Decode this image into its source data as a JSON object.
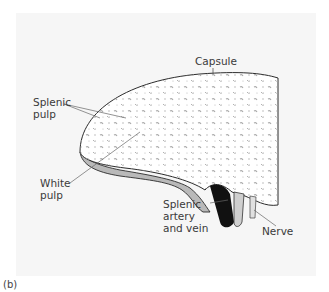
{
  "figure": {
    "panel_label": "(b)",
    "colors": {
      "background_panel": "#f6f6f6",
      "outline": "#2b2b2b",
      "white_pulp_band": "#b9b9b9",
      "speckle": "#9a9a9a",
      "vessel_dark": "#111111",
      "vessel_light": "#cfcfcf"
    },
    "labels": {
      "capsule": "Capsule",
      "splenic_pulp": "Splenic\npulp",
      "white_pulp": "White\npulp",
      "splenic_artery_vein": "Splenic\nartery\nand vein",
      "nerve": "Nerve"
    }
  }
}
